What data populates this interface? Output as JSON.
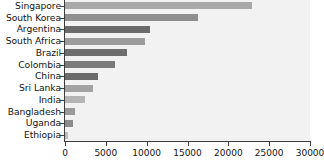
{
  "chart_data": {
    "type": "bar",
    "orientation": "horizontal",
    "title": "",
    "subtitle": "",
    "xlabel": "",
    "ylabel": "",
    "xlim": [
      0,
      30000
    ],
    "xticks": [
      0,
      5000,
      10000,
      15000,
      20000,
      25000,
      30000
    ],
    "xtick_labels": [
      "0",
      "5000",
      "10000",
      "15000",
      "20000",
      "25000",
      "30000"
    ],
    "grid": false,
    "legend": "none",
    "plot_background": "#f2f2f2",
    "axis_color": "#3c3c3c",
    "categories": [
      "Singapore",
      "South Korea",
      "Argentina",
      "South Africa",
      "Brazil",
      "Colombia",
      "China",
      "Sri Lanka",
      "India",
      "Bangladesh",
      "Uganda",
      "Ethiopia"
    ],
    "values": [
      22900,
      16300,
      10400,
      9800,
      7600,
      6100,
      4000,
      3400,
      2450,
      1250,
      1000,
      400
    ],
    "bar_colors": [
      "#a8a8a8",
      "#8f8f8f",
      "#6b6b6b",
      "#9d9d9d",
      "#6e6e6e",
      "#7a7a7a",
      "#6b6b6b",
      "#a2a2a2",
      "#b4b4b4",
      "#9a9a9a",
      "#8b8b8b",
      "#bdbdbd"
    ]
  }
}
